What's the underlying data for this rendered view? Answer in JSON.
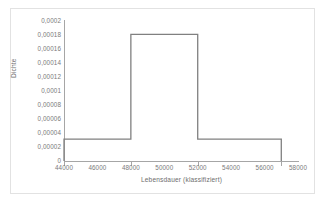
{
  "chart_data": {
    "type": "bar",
    "subtype": "histogram-density-outline",
    "title": "",
    "xlabel": "Lebensdauer (klassifiziert)",
    "ylabel": "Dichte",
    "xlim": [
      44000,
      58000
    ],
    "ylim": [
      0,
      0.0002
    ],
    "grid": false,
    "legend": null,
    "decimal_separator": ",",
    "bin_edges": [
      44000,
      48000,
      52000,
      57000
    ],
    "categories": [
      "44000-48000",
      "48000-52000",
      "52000-57000"
    ],
    "values": [
      3.13e-05,
      0.000181,
      3.13e-05
    ],
    "bars": [
      {
        "x_start": 44000,
        "x_end": 48000,
        "density": 3.13e-05
      },
      {
        "x_start": 48000,
        "x_end": 52000,
        "density": 0.000181
      },
      {
        "x_start": 52000,
        "x_end": 57000,
        "density": 3.13e-05
      }
    ],
    "xticks": [
      44000,
      46000,
      48000,
      50000,
      52000,
      54000,
      56000,
      58000
    ],
    "xtick_labels": [
      "44000",
      "46000",
      "48000",
      "50000",
      "52000",
      "54000",
      "56000",
      "58000"
    ],
    "x_tickmarks_drawn_at": [
      44000,
      48000,
      52000,
      57000
    ],
    "yticks": [
      0,
      2e-05,
      4e-05,
      6e-05,
      8e-05,
      0.0001,
      0.00012,
      0.00014,
      0.00016,
      0.00018,
      0.0002
    ],
    "ytick_labels": [
      "0,0002",
      "0,00018",
      "0,00016",
      "0,00014",
      "0,00012",
      "0,0001",
      "0,00008",
      "0,00006",
      "0,00004",
      "0,00002",
      "0"
    ],
    "colors": {
      "bar_outline": "#808080",
      "bar_fill": "none",
      "axis": "#a6a6a6",
      "tick_text": "#7a7a7a",
      "axis_title": "#6e6e6e",
      "frame_border": "#e2e2e2",
      "background": "#ffffff"
    }
  }
}
